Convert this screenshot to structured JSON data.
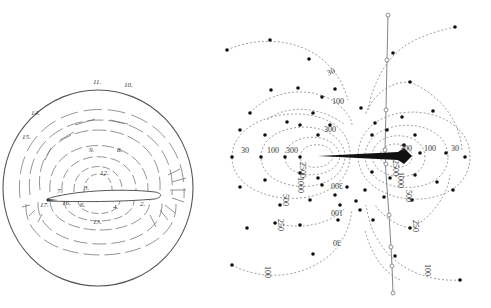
{
  "left_panel": {
    "title": "field sketch around fish",
    "circle": {
      "cx": 98,
      "cy": 188,
      "rx": 95,
      "ry": 98
    },
    "numbers": [
      {
        "label": "11.",
        "x": 93,
        "y": 84
      },
      {
        "label": "10.",
        "x": 124,
        "y": 87
      },
      {
        "label": "14.",
        "x": 31,
        "y": 115
      },
      {
        "label": "15.",
        "x": 22,
        "y": 139
      },
      {
        "label": "9.",
        "x": 89,
        "y": 152
      },
      {
        "label": "8.",
        "x": 117,
        "y": 152
      },
      {
        "label": "12.",
        "x": 100,
        "y": 175
      },
      {
        "label": "7.",
        "x": 57,
        "y": 193
      },
      {
        "label": "3.",
        "x": 84,
        "y": 190
      },
      {
        "label": "17.",
        "x": 40,
        "y": 207
      },
      {
        "label": "16.",
        "x": 62,
        "y": 205
      },
      {
        "label": "6.",
        "x": 80,
        "y": 207
      },
      {
        "label": "4.",
        "x": 113,
        "y": 209
      },
      {
        "label": "2.",
        "x": 140,
        "y": 206
      },
      {
        "label": "13.",
        "x": 93,
        "y": 224
      }
    ]
  },
  "right_panel": {
    "title": "isopotential / field map",
    "axis_points": [
      [
        388,
        15
      ],
      [
        387,
        60
      ],
      [
        386,
        110
      ],
      [
        385,
        150
      ],
      [
        386,
        174
      ],
      [
        389,
        215
      ],
      [
        391,
        247
      ],
      [
        392,
        266
      ],
      [
        393,
        293
      ]
    ],
    "labels": [
      {
        "label": "30",
        "x": 332,
        "y": 74,
        "rot": -25
      },
      {
        "label": "100",
        "x": 338,
        "y": 104,
        "rot": 0
      },
      {
        "label": "300",
        "x": 330,
        "y": 132,
        "rot": 0
      },
      {
        "label": "30",
        "x": 245,
        "y": 153,
        "rot": 0
      },
      {
        "label": "100",
        "x": 273,
        "y": 153,
        "rot": 0
      },
      {
        "label": "300",
        "x": 292,
        "y": 153,
        "rot": 0
      },
      {
        "label": "2500",
        "x": 300,
        "y": 170,
        "rot": 90
      },
      {
        "label": "1000",
        "x": 298,
        "y": 185,
        "rot": 90
      },
      {
        "label": "500",
        "x": 283,
        "y": 200,
        "rot": 90
      },
      {
        "label": "300",
        "x": 337,
        "y": 183,
        "rot": 180
      },
      {
        "label": "100",
        "x": 337,
        "y": 210,
        "rot": 180
      },
      {
        "label": "30",
        "x": 337,
        "y": 240,
        "rot": 180
      },
      {
        "label": "250",
        "x": 278,
        "y": 225,
        "rot": 90
      },
      {
        "label": "100",
        "x": 265,
        "y": 272,
        "rot": 90
      },
      {
        "label": "300",
        "x": 406,
        "y": 151,
        "rot": 0
      },
      {
        "label": "100",
        "x": 430,
        "y": 151,
        "rot": 0
      },
      {
        "label": "30",
        "x": 455,
        "y": 151,
        "rot": 0
      },
      {
        "label": "2500",
        "x": 393,
        "y": 168,
        "rot": 90
      },
      {
        "label": "1000",
        "x": 398,
        "y": 180,
        "rot": 90
      },
      {
        "label": "500",
        "x": 406,
        "y": 196,
        "rot": 90
      },
      {
        "label": "250",
        "x": 413,
        "y": 226,
        "rot": 90
      },
      {
        "label": "100",
        "x": 425,
        "y": 270,
        "rot": 90
      }
    ]
  }
}
